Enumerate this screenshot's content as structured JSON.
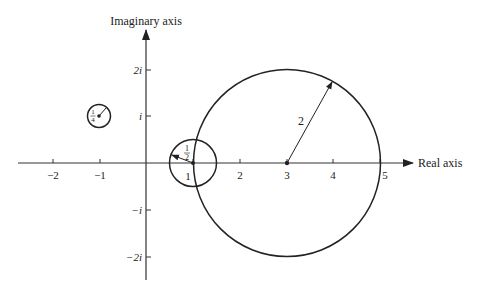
{
  "diagram": {
    "type": "complex-plane",
    "axes": {
      "real_label": "Real axis",
      "imag_label": "Imaginary axis",
      "real_ticks": [
        {
          "value": -2,
          "label": "−2"
        },
        {
          "value": -1,
          "label": "−1"
        },
        {
          "value": 1,
          "label": "1"
        },
        {
          "value": 2,
          "label": "2"
        },
        {
          "value": 3,
          "label": "3"
        },
        {
          "value": 4,
          "label": "4"
        },
        {
          "value": 5,
          "label": "5"
        }
      ],
      "imag_ticks": [
        {
          "value": 2,
          "label": "2i"
        },
        {
          "value": 1,
          "label": "i"
        },
        {
          "value": -1,
          "label": "−i"
        },
        {
          "value": -2,
          "label": "−2i"
        }
      ]
    },
    "circles": [
      {
        "name": "small-circle",
        "center": [
          -1,
          1
        ],
        "radius": 0.25,
        "radius_label": "1/4",
        "radius_label_num": "1",
        "radius_label_den": "4"
      },
      {
        "name": "medium-circle",
        "center": [
          1,
          0
        ],
        "radius": 0.5,
        "radius_label": "1/2",
        "radius_label_num": "1",
        "radius_label_den": "2"
      },
      {
        "name": "large-circle",
        "center": [
          3,
          0
        ],
        "radius": 2,
        "radius_label": "2"
      }
    ],
    "colors": {
      "ink": "#222222",
      "axis": "#333333",
      "background": "#ffffff"
    }
  }
}
